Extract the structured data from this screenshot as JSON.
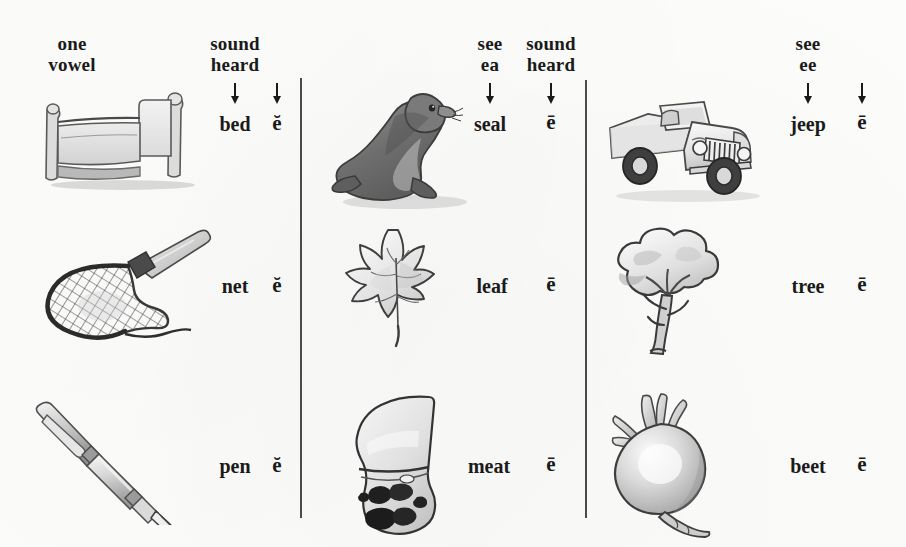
{
  "page": {
    "background_color": "#fdfdfc",
    "ink_color": "#1a1a1a"
  },
  "columns": [
    {
      "id": "column-1",
      "headers": [
        {
          "name": "spelling-header",
          "lines": [
            "one",
            "vowel"
          ]
        },
        {
          "name": "word-header",
          "lines": [
            "sound",
            "heard"
          ]
        }
      ],
      "rows": [
        {
          "picture": "bed-illustration",
          "word": "bed",
          "vowel": "ĕ"
        },
        {
          "picture": "net-illustration",
          "word": "net",
          "vowel": "ĕ"
        },
        {
          "picture": "pen-illustration",
          "word": "pen",
          "vowel": "ĕ"
        }
      ]
    },
    {
      "id": "column-2",
      "headers": [
        {
          "name": "spelling-header",
          "lines": [
            "see",
            "ea"
          ]
        },
        {
          "name": "word-header",
          "lines": [
            "sound",
            "heard"
          ]
        }
      ],
      "rows": [
        {
          "picture": "seal-illustration",
          "word": "seal",
          "vowel": "ē"
        },
        {
          "picture": "leaf-illustration",
          "word": "leaf",
          "vowel": "ē"
        },
        {
          "picture": "meat-illustration",
          "word": "meat",
          "vowel": "ē"
        }
      ]
    },
    {
      "id": "column-3",
      "headers": [
        {
          "name": "spelling-header",
          "lines": [
            "see",
            "ee"
          ]
        },
        {
          "name": "word-header",
          "lines": [
            "",
            ""
          ]
        }
      ],
      "rows": [
        {
          "picture": "jeep-illustration",
          "word": "jeep",
          "vowel": "ē"
        },
        {
          "picture": "tree-illustration",
          "word": "tree",
          "vowel": "ē"
        },
        {
          "picture": "beet-illustration",
          "word": "beet",
          "vowel": "ē"
        }
      ]
    }
  ],
  "labels": {
    "c1_h1_l1": "one",
    "c1_h1_l2": "vowel",
    "c1_h2_l1": "sound",
    "c1_h2_l2": "heard",
    "c1_r1_word": "bed",
    "c1_r1_vowel": "ĕ",
    "c1_r2_word": "net",
    "c1_r2_vowel": "ĕ",
    "c1_r3_word": "pen",
    "c1_r3_vowel": "ĕ",
    "c2_h1_l1": "see",
    "c2_h1_l2": "ea",
    "c2_h2_l1": "sound",
    "c2_h2_l2": "heard",
    "c2_r1_word": "seal",
    "c2_r1_vowel": "ē",
    "c2_r2_word": "leaf",
    "c2_r2_vowel": "ē",
    "c2_r3_word": "meat",
    "c2_r3_vowel": "ē",
    "c3_h1_l1": "see",
    "c3_h1_l2": "ee",
    "c3_r1_word": "jeep",
    "c3_r1_vowel": "ē",
    "c3_r2_word": "tree",
    "c3_r2_vowel": "ē",
    "c3_r3_word": "beet",
    "c3_r3_vowel": "ē"
  }
}
